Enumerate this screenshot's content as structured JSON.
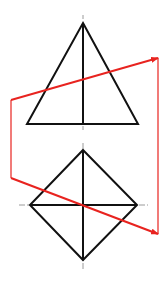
{
  "colors": {
    "background": "#ffffff",
    "outline": "#111111",
    "centerline": "#9a9a9a",
    "section": "#e8231f"
  },
  "front_view": {
    "type": "triangle",
    "apex": [
      83,
      23
    ],
    "base_left": [
      27,
      124
    ],
    "base_right": [
      138,
      124
    ],
    "axis": {
      "x": 83,
      "y1": 23,
      "y2": 124
    },
    "centerline_ticks": [
      [
        83,
        15,
        83,
        19
      ],
      [
        83,
        126,
        83,
        130
      ]
    ]
  },
  "top_view": {
    "type": "diamond",
    "top": [
      83,
      150
    ],
    "right": [
      137,
      205
    ],
    "bottom": [
      83,
      260
    ],
    "left": [
      30,
      205
    ],
    "centerline_h": {
      "x1": 19,
      "x2": 148,
      "y": 205
    },
    "centerline_v": {
      "x": 83,
      "y1": 143,
      "y2": 269
    }
  },
  "section_lines": {
    "upper_arrow": {
      "from": [
        11,
        100
      ],
      "to": [
        158,
        58
      ]
    },
    "lower_arrow": {
      "from": [
        11,
        178
      ],
      "to": [
        158,
        234
      ]
    },
    "left_vertical": {
      "x": 11,
      "y1": 100,
      "y2": 178
    },
    "right_vertical": {
      "x": 158,
      "y1": 58,
      "y2": 234
    }
  }
}
